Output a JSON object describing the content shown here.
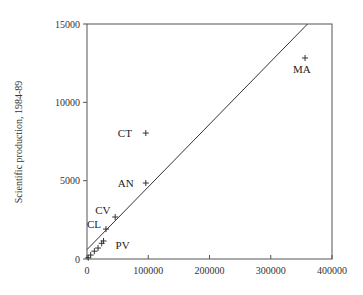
{
  "chart_data": {
    "type": "scatter",
    "title": "",
    "xlabel": "",
    "ylabel": "Scientific production, 1984-89",
    "xlim": [
      0,
      400000
    ],
    "ylim": [
      0,
      15000
    ],
    "xticks": [
      "0",
      "100000",
      "200000",
      "300000",
      "400000"
    ],
    "yticks": [
      "0",
      "5000",
      "10000",
      "15000"
    ],
    "grid": false,
    "reference_line": {
      "type": "diagonal",
      "from": [
        0,
        600
      ],
      "to": [
        360000,
        15000
      ]
    },
    "points": [
      {
        "label": "MA",
        "x": 356000,
        "y": 12830
      },
      {
        "label": "CT",
        "x": 96000,
        "y": 8040
      },
      {
        "label": "AN",
        "x": 96000,
        "y": 4850
      },
      {
        "label": "CV",
        "x": 46000,
        "y": 2680
      },
      {
        "label": "CL",
        "x": 31000,
        "y": 1910
      },
      {
        "label": "PV",
        "x": 27000,
        "y": 1150
      },
      {
        "label": "",
        "x": 24000,
        "y": 1000
      },
      {
        "label": "",
        "x": 18000,
        "y": 700
      },
      {
        "label": "",
        "x": 12000,
        "y": 500
      },
      {
        "label": "",
        "x": 6000,
        "y": 250
      },
      {
        "label": "",
        "x": 2000,
        "y": 80
      }
    ]
  }
}
